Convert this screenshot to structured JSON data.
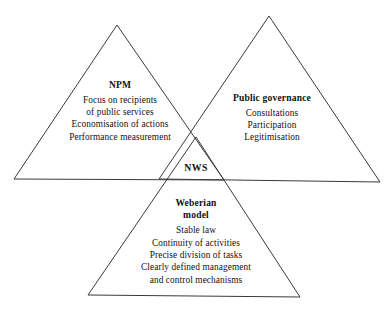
{
  "diagram": {
    "stroke_color": "#3a3a3a",
    "background_color": "#ffffff",
    "center_label": "NWS",
    "triangles": [
      {
        "id": "npm",
        "heading": "NPM",
        "items": [
          "Focus on recipients",
          "of public services",
          "Economisation of actions",
          "Performance measurement"
        ],
        "apex": {
          "x": 117,
          "y": 25
        },
        "base_left": {
          "x": 14,
          "y": 179
        },
        "base_right": {
          "x": 224,
          "y": 180
        }
      },
      {
        "id": "public-governance",
        "heading": "Public governance",
        "items": [
          "Consultations",
          "Participation",
          "Legitimisation"
        ],
        "apex": {
          "x": 269,
          "y": 16
        },
        "base_left": {
          "x": 159,
          "y": 179
        },
        "base_right": {
          "x": 380,
          "y": 182
        }
      },
      {
        "id": "weberian-model",
        "heading_line1": "Weberian",
        "heading_line2": "model",
        "items": [
          "Stable law",
          "Continuity of activities",
          "Precise division of tasks",
          "Clearly defined management",
          "and control mechanisms"
        ],
        "apex": {
          "x": 196,
          "y": 137
        },
        "base_left": {
          "x": 88,
          "y": 295
        },
        "base_right": {
          "x": 300,
          "y": 297
        }
      }
    ]
  }
}
